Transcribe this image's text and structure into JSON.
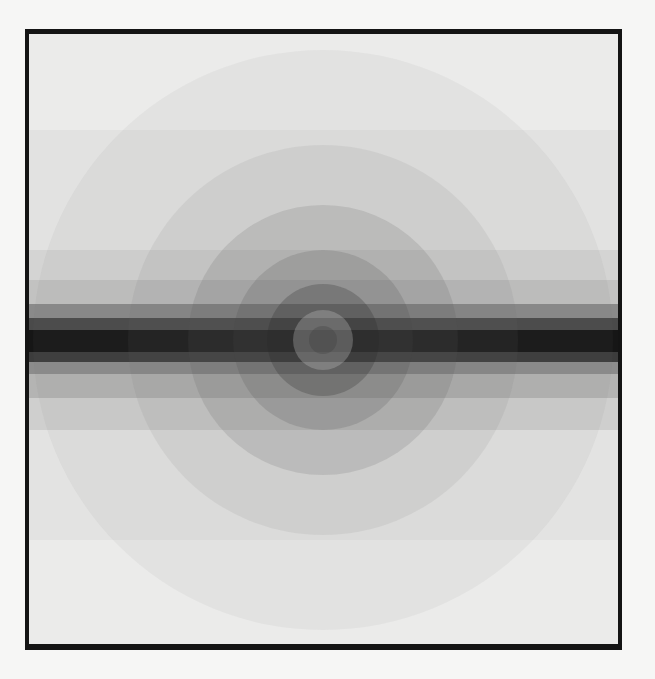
{
  "artwork": {
    "description": "Abstract grayscale painting of concentric circles overlaid by horizontal bands darkening toward the center",
    "frame_color": "#141414",
    "background_color": "#f6f6f5",
    "canvas_color": "#ebebea",
    "center": {
      "x": 294,
      "y": 306
    },
    "bands": [
      {
        "top": 96,
        "height": 120,
        "color": "#e2e2e1"
      },
      {
        "top": 216,
        "height": 30,
        "color": "#d4d4d3"
      },
      {
        "top": 246,
        "height": 24,
        "color": "#c2c2c1"
      },
      {
        "top": 270,
        "height": 14,
        "color": "#8a8a8a"
      },
      {
        "top": 284,
        "height": 12,
        "color": "#4a4a4a"
      },
      {
        "top": 296,
        "height": 22,
        "color": "#161616"
      },
      {
        "top": 318,
        "height": 10,
        "color": "#3c3c3c"
      },
      {
        "top": 328,
        "height": 12,
        "color": "#8c8c8c"
      },
      {
        "top": 340,
        "height": 24,
        "color": "#b4b4b3"
      },
      {
        "top": 364,
        "height": 32,
        "color": "#cfcfce"
      },
      {
        "top": 396,
        "height": 110,
        "color": "#e3e3e2"
      }
    ],
    "rings": [
      {
        "radius": 290,
        "color": "rgba(120,120,120,0.07)"
      },
      {
        "radius": 195,
        "color": "rgba(110,110,110,0.10)"
      },
      {
        "radius": 135,
        "color": "rgba(90,90,90,0.16)"
      },
      {
        "radius": 90,
        "color": "rgba(70,70,70,0.18)"
      },
      {
        "radius": 56,
        "color": "rgba(40,40,40,0.25)"
      },
      {
        "radius": 30,
        "color": "rgba(200,200,200,0.30)"
      },
      {
        "radius": 14,
        "color": "rgba(60,60,60,0.30)"
      }
    ]
  }
}
